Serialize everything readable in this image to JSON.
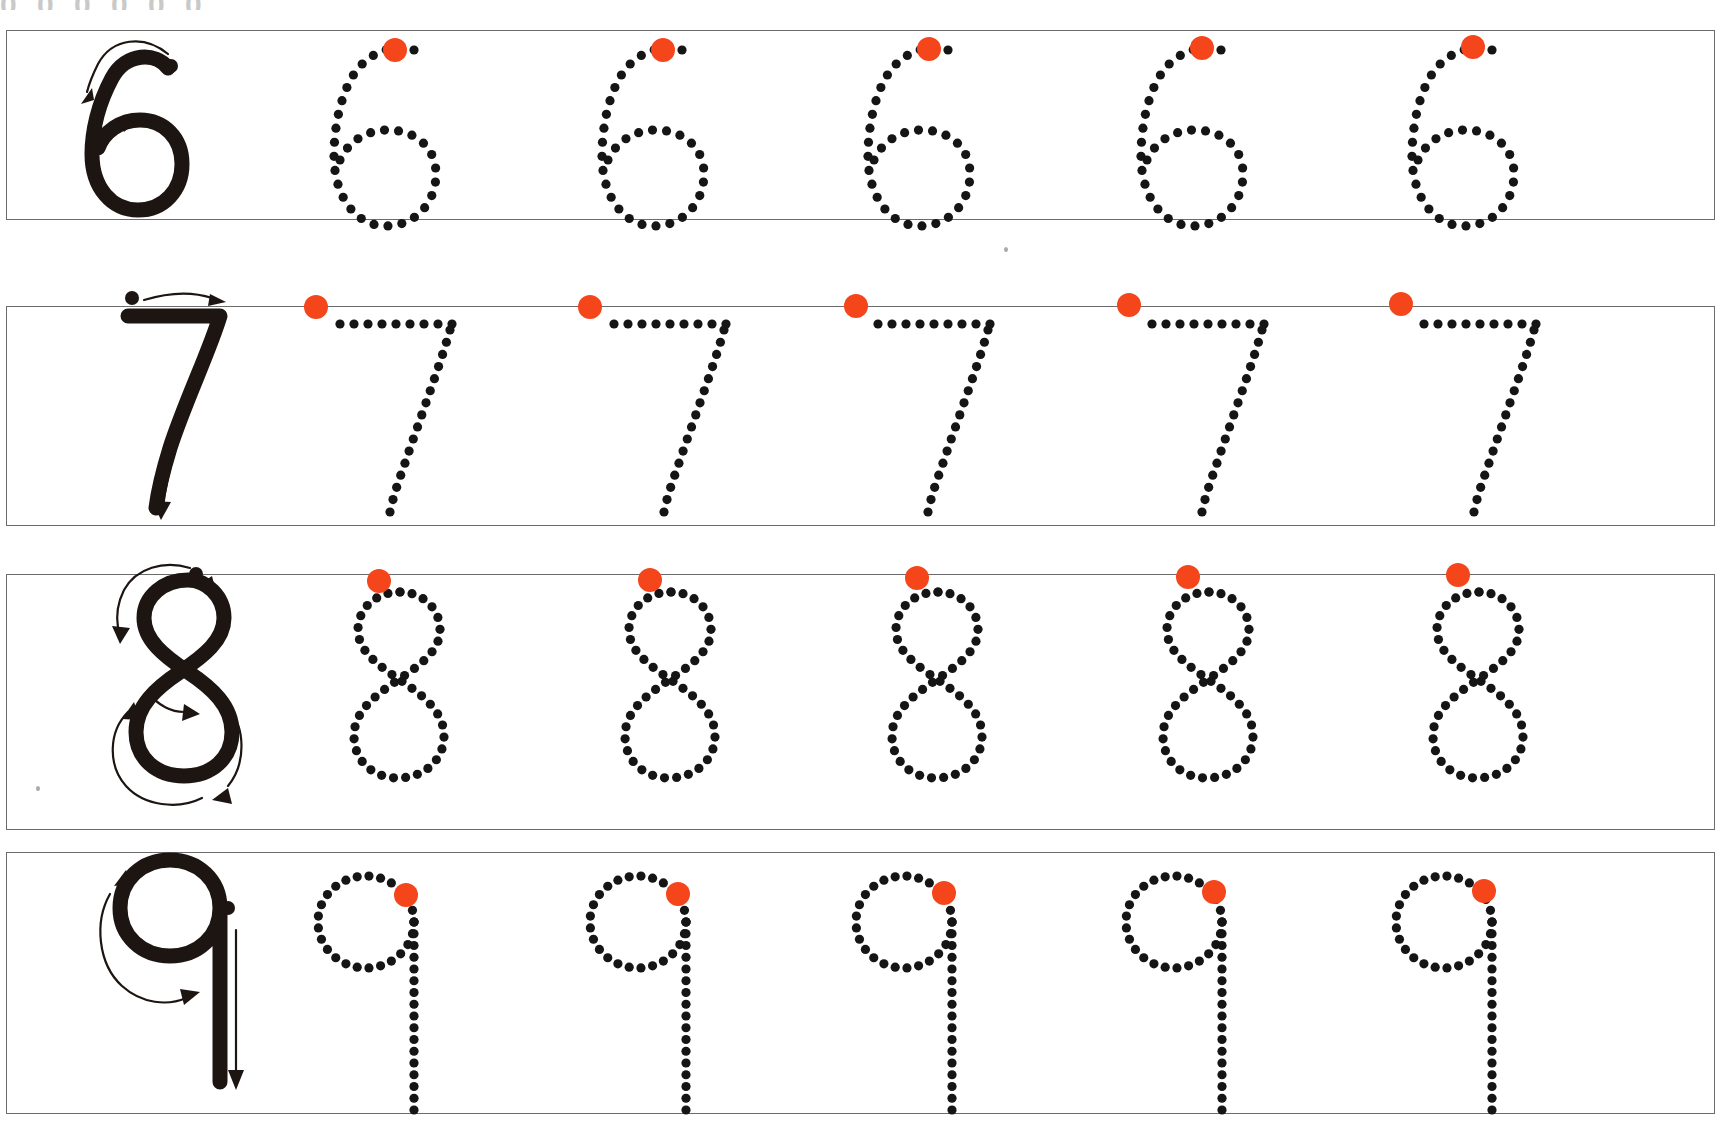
{
  "worksheet": {
    "title_bleed": "0 0 0 0 0 0",
    "kind": "number-tracing-worksheet",
    "page_width": 1728,
    "page_height": 1129,
    "background_color": "#ffffff",
    "ink_color": "#1d1512",
    "dot_color": "#151515",
    "start_dot_color": "#F5451B",
    "frame_color": "#6b6b6b",
    "traces_per_row": 5
  },
  "rows": [
    {
      "numeral": "6",
      "name": "row-six",
      "frame": {
        "x": 6,
        "y": 30,
        "width": 1709,
        "height": 190
      },
      "model": {
        "label": "6",
        "x": 40,
        "y": 20,
        "start_dot": "top-right",
        "strokes": 1,
        "arrows": 2
      },
      "traces": [
        {
          "index": 1,
          "cx": 362,
          "start_dot": {
            "x": 395,
            "y": 50
          }
        },
        {
          "index": 2,
          "cx": 630,
          "start_dot": {
            "x": 663,
            "y": 50
          }
        },
        {
          "index": 3,
          "cx": 896,
          "start_dot": {
            "x": 929,
            "y": 49
          }
        },
        {
          "index": 4,
          "cx": 1169,
          "start_dot": {
            "x": 1202,
            "y": 48
          }
        },
        {
          "index": 5,
          "cx": 1440,
          "start_dot": {
            "x": 1473,
            "y": 47
          }
        }
      ]
    },
    {
      "numeral": "7",
      "name": "row-seven",
      "frame": {
        "x": 6,
        "y": 306,
        "width": 1709,
        "height": 220
      },
      "model": {
        "label": "7",
        "x": 60,
        "y": 296,
        "start_dot": "top-left",
        "strokes": 1,
        "arrows": 2
      },
      "traces": [
        {
          "index": 1,
          "cx": 352,
          "start_dot": {
            "x": 316,
            "y": 307
          }
        },
        {
          "index": 2,
          "cx": 626,
          "start_dot": {
            "x": 590,
            "y": 307
          }
        },
        {
          "index": 3,
          "cx": 890,
          "start_dot": {
            "x": 856,
            "y": 306
          }
        },
        {
          "index": 4,
          "cx": 1164,
          "start_dot": {
            "x": 1129,
            "y": 305
          }
        },
        {
          "index": 5,
          "cx": 1436,
          "start_dot": {
            "x": 1401,
            "y": 304
          }
        }
      ]
    },
    {
      "numeral": "8",
      "name": "row-eight",
      "frame": {
        "x": 6,
        "y": 574,
        "width": 1709,
        "height": 256
      },
      "model": {
        "label": "8",
        "x": 60,
        "y": 560,
        "start_dot": "top-center",
        "strokes": 1,
        "arrows": 4
      },
      "traces": [
        {
          "index": 1,
          "cx": 362,
          "start_dot": {
            "x": 379,
            "y": 581
          }
        },
        {
          "index": 2,
          "cx": 633,
          "start_dot": {
            "x": 650,
            "y": 580
          }
        },
        {
          "index": 3,
          "cx": 900,
          "start_dot": {
            "x": 917,
            "y": 578
          }
        },
        {
          "index": 4,
          "cx": 1171,
          "start_dot": {
            "x": 1188,
            "y": 577
          }
        },
        {
          "index": 5,
          "cx": 1441,
          "start_dot": {
            "x": 1458,
            "y": 575
          }
        }
      ]
    },
    {
      "numeral": "9",
      "name": "row-nine",
      "frame": {
        "x": 6,
        "y": 852,
        "width": 1709,
        "height": 262
      },
      "model": {
        "label": "9",
        "x": 60,
        "y": 838,
        "start_dot": "top-right",
        "strokes": 1,
        "arrows": 2
      },
      "traces": [
        {
          "index": 1,
          "cx": 360,
          "start_dot": {
            "x": 406,
            "y": 895
          }
        },
        {
          "index": 2,
          "cx": 632,
          "start_dot": {
            "x": 678,
            "y": 894
          }
        },
        {
          "index": 3,
          "cx": 898,
          "start_dot": {
            "x": 944,
            "y": 893
          }
        },
        {
          "index": 4,
          "cx": 1168,
          "start_dot": {
            "x": 1214,
            "y": 892
          }
        },
        {
          "index": 5,
          "cx": 1438,
          "start_dot": {
            "x": 1484,
            "y": 891
          }
        }
      ]
    }
  ],
  "specks": [
    {
      "x": 36,
      "y": 786
    },
    {
      "x": 1004,
      "y": 247
    }
  ]
}
